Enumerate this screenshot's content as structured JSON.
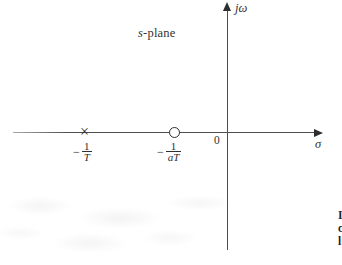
{
  "figure": {
    "plane_label": {
      "italic": "s",
      "rest": "-plane"
    },
    "axes": {
      "vertical_label": "jω",
      "horizontal_label": "σ",
      "origin_label": "0"
    },
    "pole": {
      "marker": "×",
      "value": "-1/T",
      "label": {
        "sign": "−",
        "numerator": "1",
        "denominator": "T"
      }
    },
    "zero": {
      "marker": "circle",
      "value": "-1/aT",
      "label": {
        "sign": "−",
        "numerator": "1",
        "denominator": "aT"
      }
    },
    "edge_text_fragments": [
      "I",
      "c",
      "l"
    ],
    "colors": {
      "axis_line": "#4f4f4f",
      "text": "#2f2f2f",
      "background": "#ffffff"
    }
  }
}
